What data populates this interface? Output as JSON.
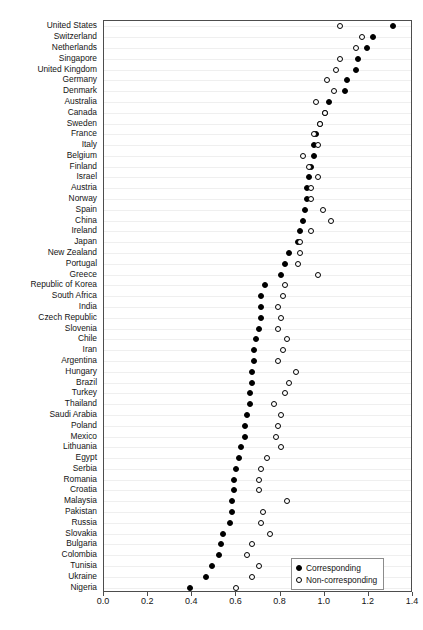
{
  "chart_data": {
    "type": "scatter",
    "title": "",
    "xlabel": "",
    "ylabel": "",
    "xlim": [
      0.0,
      1.4
    ],
    "ylim_categories": 52,
    "grid": true,
    "grid_axis": "y",
    "legend_position": "bottom-right",
    "orientation": "horizontal",
    "xticks": [
      "0.0",
      "0.2",
      "0.4",
      "0.6",
      "0.8",
      "1.0",
      "1.2",
      "1.4"
    ],
    "xtick_values": [
      0.0,
      0.2,
      0.4,
      0.6,
      0.8,
      1.0,
      1.2,
      1.4
    ],
    "categories": [
      "United States",
      "Switzerland",
      "Netherlands",
      "Singapore",
      "United Kingdom",
      "Germany",
      "Denmark",
      "Australia",
      "Canada",
      "Sweden",
      "France",
      "Italy",
      "Belgium",
      "Finland",
      "Israel",
      "Austria",
      "Norway",
      "Spain",
      "China",
      "Ireland",
      "Japan",
      "New Zealand",
      "Portugal",
      "Greece",
      "Republic of Korea",
      "South Africa",
      "India",
      "Czech Republic",
      "Slovenia",
      "Chile",
      "Iran",
      "Argentina",
      "Hungary",
      "Brazil",
      "Turkey",
      "Thailand",
      "Saudi Arabia",
      "Poland",
      "Mexico",
      "Lithuania",
      "Egypt",
      "Serbia",
      "Romania",
      "Croatia",
      "Malaysia",
      "Pakistan",
      "Russia",
      "Slovakia",
      "Bulgaria",
      "Colombia",
      "Tunisia",
      "Ukraine",
      "Nigeria"
    ],
    "series": [
      {
        "name": "Corresponding",
        "marker": "filled-circle",
        "color": "#000000",
        "values": [
          1.31,
          1.22,
          1.19,
          1.15,
          1.14,
          1.1,
          1.09,
          1.02,
          1.0,
          0.98,
          0.96,
          0.95,
          0.95,
          0.94,
          0.93,
          0.92,
          0.92,
          0.91,
          0.9,
          0.89,
          0.88,
          0.84,
          0.82,
          0.8,
          0.73,
          0.71,
          0.71,
          0.71,
          0.7,
          0.69,
          0.68,
          0.68,
          0.67,
          0.67,
          0.66,
          0.66,
          0.65,
          0.64,
          0.64,
          0.62,
          0.61,
          0.6,
          0.59,
          0.59,
          0.58,
          0.58,
          0.57,
          0.54,
          0.53,
          0.52,
          0.49,
          0.46,
          0.39
        ]
      },
      {
        "name": "Non-corresponding",
        "marker": "open-circle",
        "color": "#000000",
        "values": [
          1.07,
          1.17,
          1.14,
          1.07,
          1.05,
          1.01,
          1.04,
          0.96,
          1.0,
          0.98,
          0.95,
          0.97,
          0.9,
          0.93,
          0.97,
          0.94,
          0.94,
          0.99,
          1.03,
          0.94,
          0.89,
          0.89,
          0.88,
          0.97,
          0.82,
          0.81,
          0.79,
          0.8,
          0.79,
          0.83,
          0.81,
          0.79,
          0.87,
          0.84,
          0.82,
          0.77,
          0.8,
          0.79,
          0.78,
          0.8,
          0.74,
          0.71,
          0.7,
          0.7,
          0.83,
          0.72,
          0.71,
          0.75,
          0.67,
          0.65,
          0.7,
          0.67,
          0.6
        ]
      }
    ]
  },
  "legend": {
    "items": [
      {
        "label": "Corresponding",
        "marker": "filled"
      },
      {
        "label": "Non-corresponding",
        "marker": "open"
      }
    ]
  }
}
